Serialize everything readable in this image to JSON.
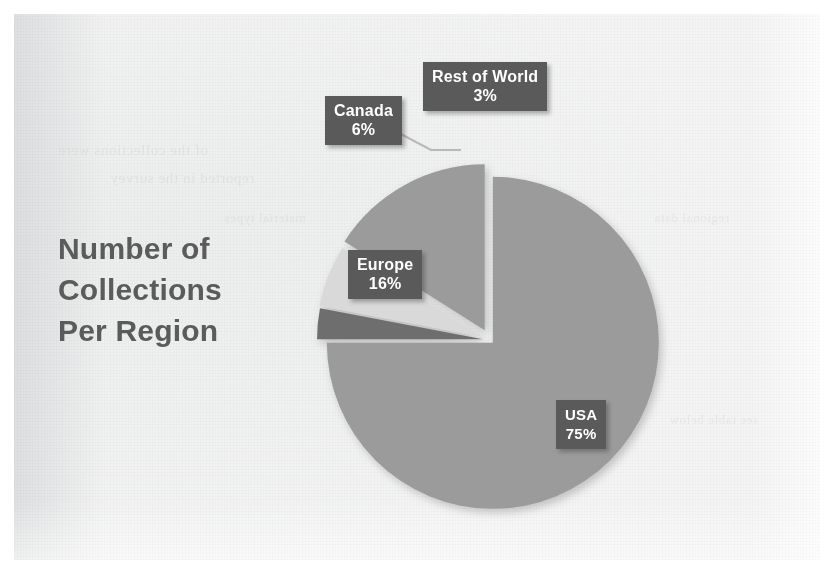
{
  "document": {
    "background_color": "#f2f2f1",
    "page_color": "#ffffff"
  },
  "chart_title": {
    "line1": "Number of",
    "line2": "Collections",
    "line3": "Per Region",
    "color": "#5b5b5b"
  },
  "labels": {
    "rest_of_world": {
      "name": "Rest of World",
      "value": "3%"
    },
    "canada": {
      "name": "Canada",
      "value": "6%"
    },
    "europe": {
      "name": "Europe",
      "value": "16%"
    },
    "usa": {
      "name": "USA",
      "value": "75%"
    }
  },
  "ghost_text": {
    "g1": "of the collections were",
    "g2": "reported in the survey",
    "g3": "material types",
    "g4": "institutions",
    "g5": "regional data",
    "g6": "see table below"
  },
  "chart_data": {
    "type": "pie",
    "title": "Number of Collections Per Region",
    "categories": [
      "USA",
      "Rest of World",
      "Canada",
      "Europe"
    ],
    "values": [
      75,
      3,
      6,
      16
    ],
    "value_labels": [
      "75%",
      "3%",
      "6%",
      "16%"
    ],
    "unit": "percent",
    "total": 100,
    "legend": "none",
    "data_labels": true,
    "start_angle_deg": 0,
    "direction": "clockwise",
    "slice_colors": {
      "USA": "#9b9b9b",
      "Rest of World": "#6e6e6e",
      "Canada": "#d9d9d9",
      "Europe": "#9b9b9b"
    },
    "exploded_slices": [
      "Canada",
      "Europe"
    ],
    "label_box_color": "#5a5a5a",
    "label_text_color": "#ffffff"
  }
}
